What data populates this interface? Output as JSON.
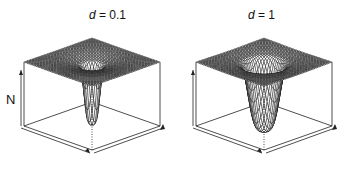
{
  "chart_data": [
    {
      "type": "surface3d",
      "title": "d = 0.1",
      "title_param": "d",
      "title_value": "0.1",
      "zlabel": "N",
      "xlabel": "",
      "ylabel": "",
      "description": "Perspective wireframe surface: flat plateau at top with a narrow deep circular well at the center; a shallow ring-shaped depression surrounds the well.",
      "well_depth_relative": 0.9,
      "well_width_relative": 0.18,
      "depression_ring_width_relative": 0.55,
      "grid": true
    },
    {
      "type": "surface3d",
      "title": "d = 1",
      "title_param": "d",
      "title_value": "1",
      "zlabel": "",
      "xlabel": "",
      "ylabel": "",
      "description": "Perspective wireframe surface: flat plateau with a wider, deeper funnel-shaped circular well at the center.",
      "well_depth_relative": 1.0,
      "well_width_relative": 0.35,
      "depression_ring_width_relative": 0.7,
      "grid": true
    }
  ],
  "panels": [
    {
      "title_prefix": "d",
      "title_rest": " = 0.1",
      "zlabel": "N"
    },
    {
      "title_prefix": "d",
      "title_rest": " = 1",
      "zlabel": ""
    }
  ],
  "colors": {
    "wire": "#111111",
    "box": "#222222",
    "background": "#ffffff"
  }
}
